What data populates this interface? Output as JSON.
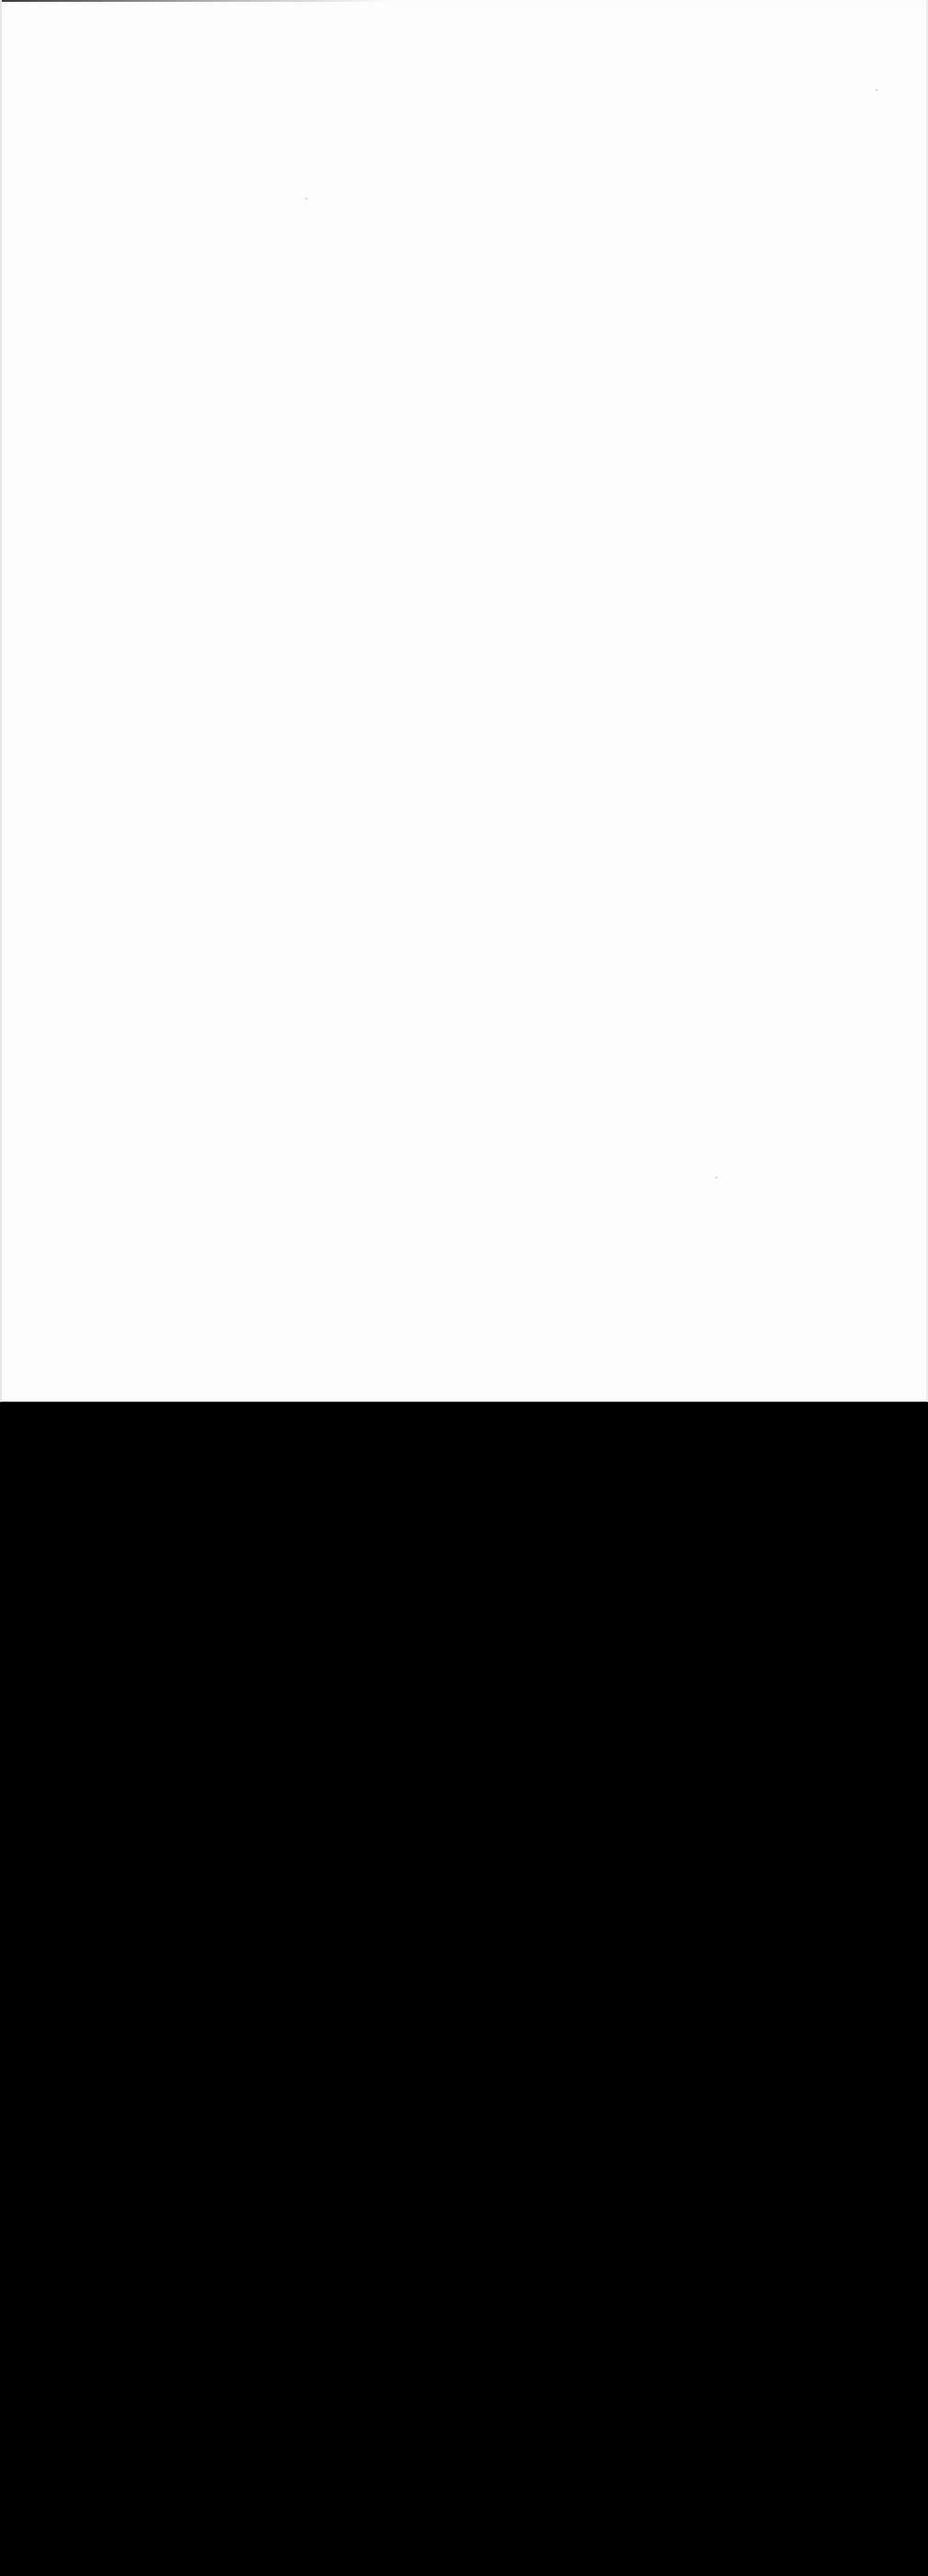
{
  "screen": {
    "description": "Blank / washed-out page region with no legible content",
    "content_area": {
      "background": "#fcfcfc",
      "height_px": 1524
    },
    "filler_area": {
      "background": "#000000"
    }
  }
}
